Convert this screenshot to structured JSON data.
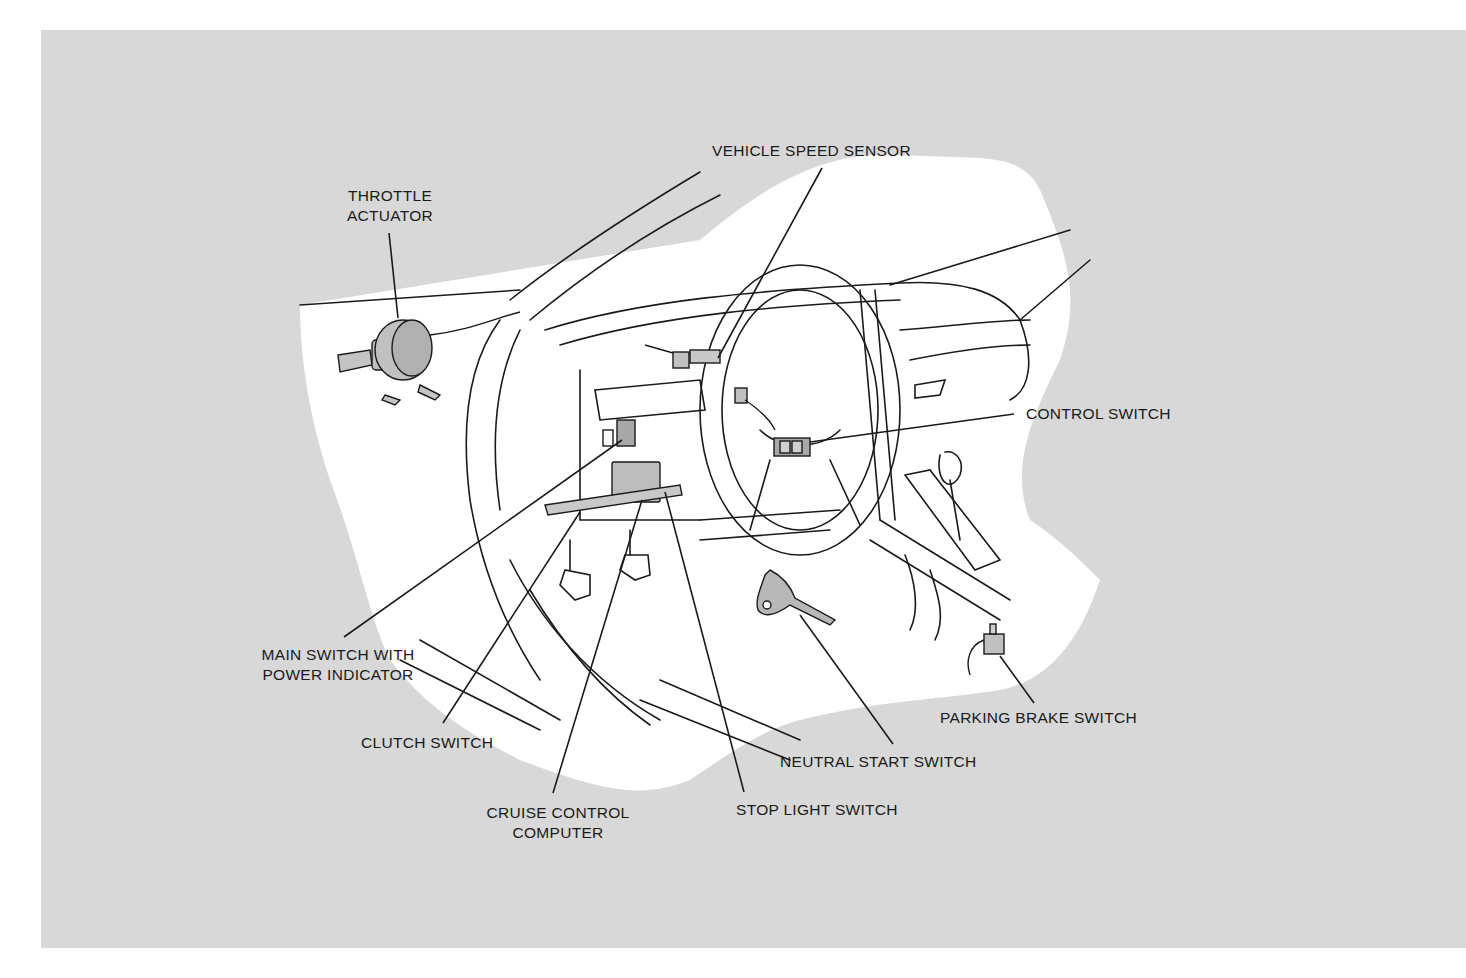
{
  "diagram": {
    "background_color": "#d8d8d8",
    "cutaway_color": "#ffffff",
    "line_color": "#1a1a1a",
    "component_fill": "#b8b8b8"
  },
  "labels": {
    "throttle_actuator": {
      "line1": "THROTTLE",
      "line2": "ACTUATOR"
    },
    "vehicle_speed_sensor": "VEHICLE SPEED SENSOR",
    "control_switch": "CONTROL SWITCH",
    "main_switch": {
      "line1": "MAIN SWITCH WITH",
      "line2": "POWER INDICATOR"
    },
    "clutch_switch": "CLUTCH SWITCH",
    "cruise_control_computer": {
      "line1": "CRUISE CONTROL",
      "line2": "COMPUTER"
    },
    "stop_light_switch": "STOP LIGHT SWITCH",
    "neutral_start_switch": "NEUTRAL START SWITCH",
    "parking_brake_switch": "PARKING BRAKE SWITCH"
  }
}
